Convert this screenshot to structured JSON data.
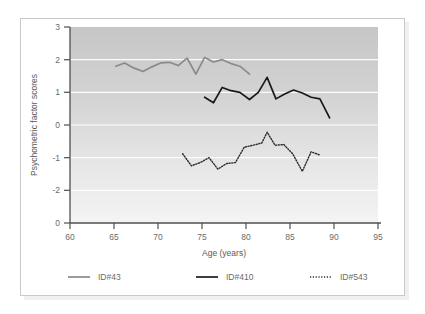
{
  "figure": {
    "border_color": "#c9c9c9",
    "background": "#ffffff"
  },
  "chart_data": {
    "type": "line",
    "title": "",
    "xlabel": "Age (years)",
    "ylabel": "Psychometric factor scores",
    "xlim": [
      60,
      95
    ],
    "ylim": [
      -3,
      3
    ],
    "xticks": [
      "60",
      "65",
      "70",
      "75",
      "80",
      "85",
      "90",
      "95"
    ],
    "yticks": [
      "3",
      "2",
      "1",
      "0",
      "-1",
      "-2",
      "0"
    ],
    "ytick_values": [
      3,
      2,
      1,
      0,
      -1,
      -2,
      -3
    ],
    "grid": "horizontal-white",
    "legend_position": "below",
    "plot_bg_gradient": [
      "#c9c9c9",
      "#f2f2f2"
    ],
    "series": [
      {
        "name": "ID#43",
        "color": "#8a8a8a",
        "style": "solid",
        "x": [
          65.2,
          66.2,
          67.3,
          68.3,
          69.3,
          70.3,
          71.3,
          72.3,
          73.3,
          74.3,
          75.3,
          76.3,
          77.3,
          78.3,
          79.3,
          80.4
        ],
        "y": [
          1.8,
          1.9,
          1.74,
          1.64,
          1.78,
          1.9,
          1.92,
          1.82,
          2.05,
          1.56,
          2.07,
          1.93,
          2.0,
          1.88,
          1.8,
          1.56
        ]
      },
      {
        "name": "ID#410",
        "color": "#1a1a1a",
        "style": "solid",
        "x": [
          75.3,
          76.3,
          77.3,
          78.3,
          79.3,
          80.4,
          81.4,
          82.4,
          83.4,
          84.4,
          85.4,
          86.4,
          87.4,
          88.4,
          89.5
        ],
        "y": [
          0.85,
          0.68,
          1.15,
          1.05,
          1.0,
          0.78,
          1.0,
          1.46,
          0.8,
          0.95,
          1.07,
          0.98,
          0.85,
          0.8,
          0.22
        ]
      },
      {
        "name": "ID#543",
        "color": "#2b2b2b",
        "style": "dotted",
        "x": [
          72.8,
          73.8,
          74.8,
          75.8,
          76.8,
          77.8,
          78.8,
          79.8,
          80.8,
          81.8,
          82.4,
          83.3,
          84.3,
          85.3,
          86.4,
          87.4,
          88.4
        ],
        "y": [
          -0.88,
          -1.25,
          -1.15,
          -1.0,
          -1.35,
          -1.18,
          -1.15,
          -0.68,
          -0.62,
          -0.55,
          -0.22,
          -0.62,
          -0.6,
          -0.88,
          -1.42,
          -0.82,
          -0.92
        ]
      }
    ]
  },
  "legend": {
    "items": [
      {
        "label": "ID#43",
        "color": "#8a8a8a",
        "style": "solid"
      },
      {
        "label": "ID#410",
        "color": "#1a1a1a",
        "style": "solid"
      },
      {
        "label": "ID#543",
        "color": "#2b2b2b",
        "style": "dotted"
      }
    ]
  }
}
